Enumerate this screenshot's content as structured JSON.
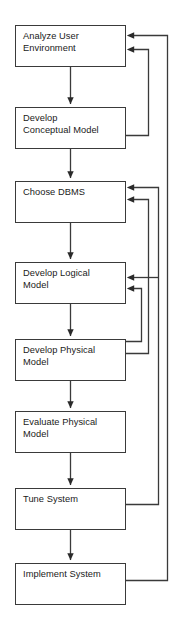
{
  "diagram": {
    "type": "flowchart",
    "orientation": "vertical",
    "canvas": {
      "width": 181,
      "height": 624
    },
    "style": {
      "background": "#ffffff",
      "box_fill": "#ffffff",
      "box_stroke": "#3a3a3a",
      "connector_stroke": "#3a3a3a",
      "text_color": "#1a1a1a"
    },
    "nodes": [
      {
        "id": "analyze-user-environment",
        "label": "Analyze User\nEnvironment",
        "x": 15,
        "y": 25,
        "w": 111,
        "h": 42
      },
      {
        "id": "develop-conceptual-model",
        "label": "Develop\nConceptual Model",
        "x": 15,
        "y": 107,
        "w": 111,
        "h": 42
      },
      {
        "id": "choose-dbms",
        "label": "Choose DBMS",
        "x": 15,
        "y": 181,
        "w": 111,
        "h": 42
      },
      {
        "id": "develop-logical-model",
        "label": "Develop Logical\nModel",
        "x": 15,
        "y": 262,
        "w": 111,
        "h": 42
      },
      {
        "id": "develop-physical-model",
        "label": "Develop Physical\nModel",
        "x": 15,
        "y": 339,
        "w": 111,
        "h": 42
      },
      {
        "id": "evaluate-physical-model",
        "label": "Evaluate Physical\nModel",
        "x": 15,
        "y": 411,
        "w": 111,
        "h": 42
      },
      {
        "id": "tune-system",
        "label": "Tune System",
        "x": 15,
        "y": 488,
        "w": 111,
        "h": 42
      },
      {
        "id": "implement-system",
        "label": "Implement System",
        "x": 15,
        "y": 563,
        "w": 111,
        "h": 42
      }
    ],
    "forward_edges": [
      {
        "id": "edge-analyze-to-conceptual",
        "from": "analyze-user-environment",
        "to": "develop-conceptual-model"
      },
      {
        "id": "edge-conceptual-to-dbms",
        "from": "develop-conceptual-model",
        "to": "choose-dbms"
      },
      {
        "id": "edge-dbms-to-logical",
        "from": "choose-dbms",
        "to": "develop-logical-model"
      },
      {
        "id": "edge-logical-to-physical",
        "from": "develop-logical-model",
        "to": "develop-physical-model"
      },
      {
        "id": "edge-physical-to-evaluate",
        "from": "develop-physical-model",
        "to": "evaluate-physical-model"
      },
      {
        "id": "edge-evaluate-to-tune",
        "from": "evaluate-physical-model",
        "to": "tune-system"
      },
      {
        "id": "edge-tune-to-implement",
        "from": "tune-system",
        "to": "implement-system"
      }
    ],
    "feedback_edges": [
      {
        "id": "feedback-conceptual-to-analyze",
        "from": "develop-conceptual-model",
        "to": "analyze-user-environment",
        "rail_x": 148,
        "exit_y": 135,
        "enter_y": 49
      },
      {
        "id": "feedback-implement-to-analyze",
        "from": "implement-system",
        "to": "analyze-user-environment",
        "rail_x": 167,
        "exit_y": 580,
        "enter_y": 35
      },
      {
        "id": "feedback-physical-to-dbms",
        "from": "develop-physical-model",
        "to": "choose-dbms",
        "rail_x": 148,
        "exit_y": 353,
        "enter_y": 199
      },
      {
        "id": "feedback-tune-to-dbms",
        "from": "tune-system",
        "to": "choose-dbms",
        "rail_x": 158,
        "exit_y": 504,
        "enter_y": 187
      },
      {
        "id": "feedback-tune-to-logical",
        "from": "tune-system",
        "to": "develop-logical-model",
        "rail_x": 158,
        "exit_y": 504,
        "enter_y": 277
      },
      {
        "id": "feedback-physical-to-logical",
        "from": "develop-physical-model",
        "to": "develop-logical-model",
        "rail_x": 141,
        "exit_y": 353,
        "enter_y": 288
      }
    ]
  }
}
